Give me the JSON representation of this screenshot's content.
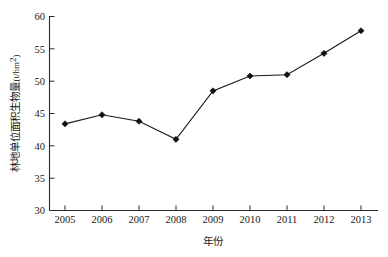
{
  "chart_data": {
    "type": "line",
    "title": "",
    "subtitle": "",
    "xlabel": "年份",
    "ylabel": "林地单位面积生物量",
    "ylabel_unit": "(t/hm2)",
    "ylabel_unit_base": "(t/hm",
    "ylabel_unit_exp": "2",
    "ylabel_unit_close": ")",
    "categories": [
      "2005",
      "2006",
      "2007",
      "2008",
      "2009",
      "2010",
      "2011",
      "2012",
      "2013"
    ],
    "x": [
      2005,
      2006,
      2007,
      2008,
      2009,
      2010,
      2011,
      2012,
      2013
    ],
    "values": [
      43.4,
      44.8,
      43.8,
      41.0,
      48.5,
      50.8,
      51.0,
      54.3,
      57.8
    ],
    "series": [
      {
        "name": "林地单位面积生物量",
        "values": [
          43.4,
          44.8,
          43.8,
          41.0,
          48.5,
          50.8,
          51.0,
          54.3,
          57.8
        ],
        "color": "#111111",
        "marker": "diamond"
      }
    ],
    "ylim": [
      30,
      60
    ],
    "yticks": [
      30,
      35,
      40,
      45,
      50,
      55,
      60
    ],
    "ytick_labels": [
      "30",
      "35",
      "40",
      "45",
      "50",
      "55",
      "60"
    ],
    "xticks": [
      2005,
      2006,
      2007,
      2008,
      2009,
      2010,
      2011,
      2012,
      2013
    ],
    "xtick_labels": [
      "2005",
      "2006",
      "2007",
      "2008",
      "2009",
      "2010",
      "2011",
      "2012",
      "2013"
    ],
    "grid": false,
    "legend": false,
    "legend_position": "none",
    "tick_direction": "in",
    "background_color": "#ffffff",
    "axis_color": "#2b2b2b"
  }
}
